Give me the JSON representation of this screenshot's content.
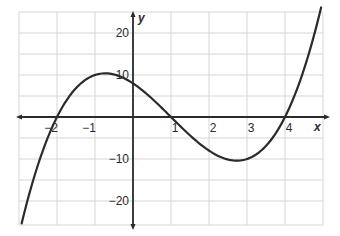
{
  "chart_data": {
    "type": "line",
    "title": "",
    "xlabel": "x",
    "ylabel": "y",
    "function": "y = x^3 - 3x^2 - 6x + 8 = (x+2)(x-1)(x-4)",
    "xlim": [
      -3,
      5
    ],
    "ylim": [
      -25,
      25
    ],
    "grid": true,
    "legend": "none",
    "x_ticks": [
      -2,
      -1,
      1,
      2,
      3,
      4
    ],
    "x_tick_labels": [
      "−2",
      "−1",
      "1",
      "2",
      "3",
      "4"
    ],
    "y_ticks": [
      20,
      10,
      -10,
      -20
    ],
    "y_tick_labels": [
      "20",
      "10",
      "−10",
      "−20"
    ],
    "roots": [
      -2,
      1,
      4
    ],
    "y_intercept": 8,
    "local_max": {
      "x": -0.73,
      "y": 10.39
    },
    "local_min": {
      "x": 2.73,
      "y": -10.39
    },
    "series": [
      {
        "name": "curve",
        "x": [
          -2.93,
          -2.5,
          -2,
          -1.5,
          -1,
          -0.73,
          -0.5,
          0,
          0.5,
          1,
          1.5,
          2,
          2.5,
          2.73,
          3,
          3.5,
          4,
          4.5,
          4.95
        ],
        "values": [
          -25.5,
          -13.1,
          0,
          6.9,
          10,
          10.39,
          9.9,
          8,
          4.4,
          0,
          -4.4,
          -8,
          -9.9,
          -10.39,
          -10,
          -6.9,
          0,
          13.1,
          26.1
        ]
      }
    ]
  },
  "axes": {
    "x_label": "x",
    "y_label": "y"
  },
  "colors": {
    "curve": "#2b2b2b",
    "axis": "#2b2b2b",
    "grid": "#d6d6d6",
    "text": "#2b2b2b"
  }
}
